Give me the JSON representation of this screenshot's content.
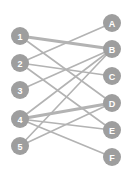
{
  "diagram": {
    "type": "bipartite-graph",
    "canvas": {
      "width": 129,
      "height": 180,
      "background": "#ffffff"
    },
    "style": {
      "node_fill": "#9e9e9e",
      "node_label_color": "#ffffff",
      "node_radius": 9,
      "edge_color": "#b3b3b3",
      "edge_width_normal": 1.6,
      "edge_width_thick": 3.2
    },
    "left_nodes": [
      {
        "id": "1",
        "label": "1",
        "x": 20,
        "y": 36
      },
      {
        "id": "2",
        "label": "2",
        "x": 20,
        "y": 63
      },
      {
        "id": "3",
        "label": "3",
        "x": 20,
        "y": 90
      },
      {
        "id": "4",
        "label": "4",
        "x": 20,
        "y": 119
      },
      {
        "id": "5",
        "label": "5",
        "x": 20,
        "y": 146
      }
    ],
    "right_nodes": [
      {
        "id": "A",
        "label": "A",
        "x": 112,
        "y": 23
      },
      {
        "id": "B",
        "label": "B",
        "x": 112,
        "y": 49
      },
      {
        "id": "C",
        "label": "C",
        "x": 112,
        "y": 76
      },
      {
        "id": "D",
        "label": "D",
        "x": 112,
        "y": 103
      },
      {
        "id": "E",
        "label": "E",
        "x": 112,
        "y": 130
      },
      {
        "id": "F",
        "label": "F",
        "x": 112,
        "y": 157
      }
    ],
    "edges": [
      {
        "from": "1",
        "to": "B",
        "weight": "thick"
      },
      {
        "from": "1",
        "to": "D",
        "weight": "normal"
      },
      {
        "from": "2",
        "to": "A",
        "weight": "normal"
      },
      {
        "from": "2",
        "to": "C",
        "weight": "normal"
      },
      {
        "from": "2",
        "to": "E",
        "weight": "normal"
      },
      {
        "from": "3",
        "to": "B",
        "weight": "normal"
      },
      {
        "from": "4",
        "to": "B",
        "weight": "normal"
      },
      {
        "from": "4",
        "to": "D",
        "weight": "thick"
      },
      {
        "from": "4",
        "to": "E",
        "weight": "normal"
      },
      {
        "from": "4",
        "to": "F",
        "weight": "normal"
      },
      {
        "from": "5",
        "to": "B",
        "weight": "normal"
      },
      {
        "from": "5",
        "to": "D",
        "weight": "normal"
      }
    ]
  }
}
